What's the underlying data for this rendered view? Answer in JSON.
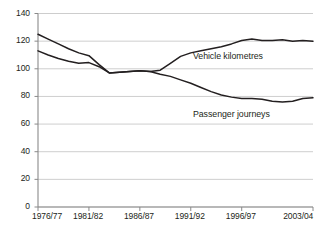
{
  "chart_data": {
    "type": "line",
    "title": "",
    "subtitle": "",
    "xlabel": "",
    "ylabel": "",
    "ylim": [
      0,
      140
    ],
    "grid": true,
    "grid_axis": "y",
    "legend_position": "inline-annotation",
    "yticks": [
      0,
      20,
      40,
      60,
      80,
      100,
      120,
      140
    ],
    "ytick_labels": [
      "0",
      "20",
      "40",
      "60",
      "80",
      "100",
      "120",
      "140"
    ],
    "x": [
      "1976/77",
      "1977/78",
      "1978/79",
      "1979/80",
      "1980/81",
      "1981/82",
      "1982/83",
      "1983/84",
      "1984/85",
      "1985/86",
      "1986/87",
      "1987/88",
      "1988/89",
      "1989/90",
      "1990/91",
      "1991/92",
      "1992/93",
      "1993/94",
      "1994/95",
      "1995/96",
      "1996/97",
      "1997/98",
      "1998/99",
      "1999/00",
      "2000/01",
      "2001/02",
      "2002/03",
      "2003/04"
    ],
    "xtick_labels": [
      "1976/77",
      "1981/82",
      "1986/87",
      "1991/92",
      "1996/97",
      "2003/04"
    ],
    "xtick_positions": [
      0,
      5,
      10,
      15,
      20,
      27
    ],
    "series": [
      {
        "name": "Vehicle kilometres",
        "color": "#231f20",
        "values": [
          125,
          121.5,
          118,
          114.5,
          111.5,
          109.5,
          103,
          97,
          97.5,
          98,
          98.5,
          98,
          99,
          104,
          109,
          111.5,
          113,
          114.5,
          116,
          118,
          120.5,
          121.5,
          120.5,
          120.5,
          121,
          120,
          120.5,
          120
        ]
      },
      {
        "name": "Passenger journeys",
        "color": "#231f20",
        "values": [
          113,
          110,
          107.5,
          105.5,
          104,
          104.5,
          101.5,
          97,
          97.5,
          98,
          98.5,
          98,
          96,
          94.5,
          92,
          89.5,
          86.5,
          83.5,
          81,
          79.5,
          78.5,
          78.5,
          78,
          76.5,
          76,
          76.5,
          78.5,
          79
        ]
      }
    ],
    "annotations": [
      {
        "text": "Vehicle kilometres",
        "x_index": 16,
        "y_value": 109
      },
      {
        "text": "Passenger journeys",
        "x_index": 16,
        "y_value": 67
      }
    ]
  }
}
